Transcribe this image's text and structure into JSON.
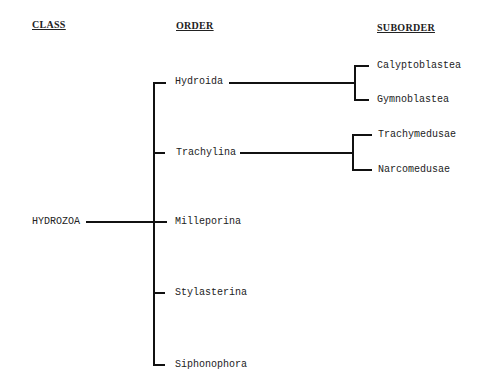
{
  "headers": {
    "class": "CLASS",
    "order": "ORDER",
    "suborder": "SUBORDER"
  },
  "class_node": {
    "label": "HYDROZOA"
  },
  "orders": [
    {
      "label": "Hydroida"
    },
    {
      "label": "Trachylina"
    },
    {
      "label": "Milleporina"
    },
    {
      "label": "Stylasterina"
    },
    {
      "label": "Siphonophora"
    }
  ],
  "suborders": {
    "hydroida": [
      {
        "label": "Calyptoblastea"
      },
      {
        "label": "Gymnoblastea"
      }
    ],
    "trachylina": [
      {
        "label": "Trachymedusae"
      },
      {
        "label": "Narcomedusae"
      }
    ]
  },
  "colors": {
    "line": "#111111",
    "text": "#222222",
    "background": "#ffffff"
  }
}
